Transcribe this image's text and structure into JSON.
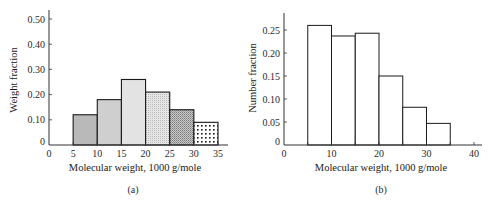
{
  "chart_data": [
    {
      "id": "a",
      "type": "bar",
      "caption": "(a)",
      "xlabel": "Molecular weight, 1000 g/mole",
      "ylabel": "Weight fraction",
      "xlim": [
        0,
        35
      ],
      "ylim": [
        0,
        0.5
      ],
      "xticks": [
        "0",
        "5",
        "10",
        "15",
        "20",
        "25",
        "30",
        "35"
      ],
      "yticks": [
        "0",
        "0.10",
        "0.20",
        "0.30",
        "0.40",
        "0.50"
      ],
      "grid": false,
      "bins": [
        [
          5,
          10
        ],
        [
          10,
          15
        ],
        [
          15,
          20
        ],
        [
          20,
          25
        ],
        [
          25,
          30
        ],
        [
          30,
          35
        ]
      ],
      "categories": [
        "5-10",
        "10-15",
        "15-20",
        "20-25",
        "25-30",
        "30-35"
      ],
      "values": [
        0.12,
        0.18,
        0.26,
        0.21,
        0.14,
        0.09
      ],
      "fills": [
        "shade-dark",
        "shade-medium",
        "shade-light",
        "fine-dots",
        "dense-dots",
        "sparse-dots"
      ]
    },
    {
      "id": "b",
      "type": "bar",
      "caption": "(b)",
      "xlabel": "Molecular weight, 1000 g/mole",
      "ylabel": "Number fraction",
      "xlim": [
        0,
        40
      ],
      "ylim": [
        0,
        0.28
      ],
      "xticks": [
        "0",
        "10",
        "20",
        "30",
        "40"
      ],
      "yticks": [
        "0",
        "0.05",
        "0.10",
        "0.15",
        "0.20",
        "0.25"
      ],
      "grid": false,
      "bins": [
        [
          5,
          10
        ],
        [
          10,
          15
        ],
        [
          15,
          20
        ],
        [
          20,
          25
        ],
        [
          25,
          30
        ],
        [
          30,
          35
        ]
      ],
      "categories": [
        "5-10",
        "10-15",
        "15-20",
        "20-25",
        "25-30",
        "30-35"
      ],
      "values": [
        0.26,
        0.237,
        0.243,
        0.15,
        0.082,
        0.047
      ],
      "fills": [
        "none",
        "none",
        "none",
        "none",
        "none",
        "none"
      ]
    }
  ]
}
